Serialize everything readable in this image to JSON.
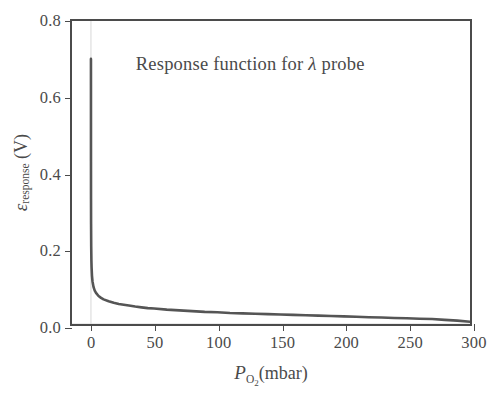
{
  "chart_data": {
    "type": "line",
    "title": "Response function for λ probe",
    "title_plain": "Response function for lambda probe",
    "xlabel": "P_O2 (mbar)",
    "xlabel_symbol": "P",
    "xlabel_subscript": "O",
    "xlabel_subscript2": "2",
    "xlabel_unit": "(mbar)",
    "ylabel": "ε_response (V)",
    "ylabel_symbol": "ε",
    "ylabel_subscript": "response",
    "ylabel_unit": "(V)",
    "xlim": [
      -15,
      300
    ],
    "ylim": [
      0.0,
      0.8
    ],
    "xticks": [
      0,
      50,
      100,
      150,
      200,
      250,
      300
    ],
    "xtick_labels": [
      "0",
      "50",
      "100",
      "150",
      "200",
      "250",
      "300"
    ],
    "yticks": [
      0.0,
      0.2,
      0.4,
      0.6,
      0.8
    ],
    "ytick_labels": [
      "0.0",
      "0.2",
      "0.4",
      "0.6",
      "0.8"
    ],
    "grid": false,
    "legend": null,
    "series": [
      {
        "name": "Response function",
        "color": "#555555",
        "linewidth": 2.6,
        "x": [
          0.0,
          0.02,
          0.05,
          0.1,
          0.2,
          0.35,
          0.5,
          0.8,
          1.2,
          2,
          3,
          4,
          6,
          8,
          10,
          14,
          18,
          22,
          26,
          30,
          35,
          40,
          45,
          50,
          60,
          70,
          80,
          90,
          100,
          110,
          120,
          130,
          140,
          150,
          160,
          170,
          180,
          190,
          200,
          210,
          220,
          230,
          240,
          250,
          260,
          270,
          280,
          290,
          300
        ],
        "y": [
          0.7,
          0.43,
          0.33,
          0.265,
          0.205,
          0.168,
          0.15,
          0.128,
          0.113,
          0.098,
          0.088,
          0.082,
          0.074,
          0.069,
          0.065,
          0.06,
          0.056,
          0.053,
          0.051,
          0.049,
          0.046,
          0.044,
          0.042,
          0.041,
          0.038,
          0.036,
          0.034,
          0.032,
          0.031,
          0.029,
          0.028,
          0.027,
          0.026,
          0.025,
          0.024,
          0.023,
          0.022,
          0.021,
          0.02,
          0.019,
          0.018,
          0.017,
          0.016,
          0.015,
          0.014,
          0.013,
          0.011,
          0.009,
          0.006
        ]
      }
    ],
    "annotations": [
      {
        "text": "Response function for λ probe",
        "x": 35,
        "y": 0.69
      }
    ],
    "reference_lines": [
      {
        "orientation": "vertical",
        "value": 0,
        "color": "#d8d8d8"
      },
      {
        "orientation": "horizontal",
        "value": 0.0,
        "color": "#d8d8d8"
      }
    ]
  },
  "axes": {
    "frame_color": "#4b4b4b",
    "background": "#ffffff"
  }
}
